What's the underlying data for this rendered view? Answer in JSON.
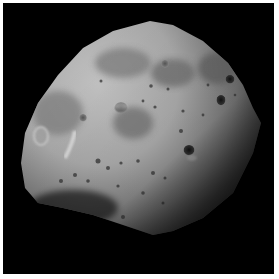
{
  "image": {
    "subject": "cratered moon surface",
    "alt": "Grayscale photograph of an irregular cratered moon against black space",
    "background_color": "#000000",
    "border_color": "#ffffff",
    "surface_highlight_color": "#bdbdbd",
    "surface_shadow_color": "#1a1a1a"
  }
}
